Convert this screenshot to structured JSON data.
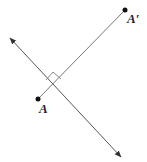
{
  "diagram": {
    "type": "reflection-perpendicular-bisector",
    "points": [
      {
        "label": "A",
        "x": 38,
        "y": 99
      },
      {
        "label": "A′",
        "x": 125,
        "y": 10
      }
    ],
    "line_of_reflection": {
      "from": [
        9,
        38
      ],
      "to": [
        121,
        157
      ],
      "arrows": "both"
    },
    "segment": {
      "from": "A",
      "to": "A′"
    },
    "right_angle_marker": true,
    "colors": {
      "line": "#555555",
      "point": "#111111",
      "marker": "#888888"
    }
  }
}
